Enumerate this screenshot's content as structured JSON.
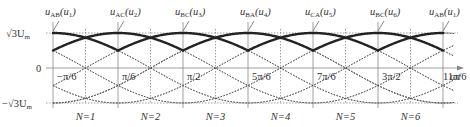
{
  "diagram": {
    "y_axis": {
      "top_label": "√3U",
      "top_sub": "m",
      "zero_label": "0",
      "bottom_label": "−√3U",
      "bottom_sub": "m"
    },
    "x_axis": {
      "label": "ωt",
      "ticks": [
        "−π/6",
        "π/6",
        "π/2",
        "5π/6",
        "7π/6",
        "3π/2",
        "11π/6"
      ]
    },
    "voltage_labels": [
      {
        "main": "u",
        "sub": "AB",
        "paren": "u",
        "psub": "1"
      },
      {
        "main": "u",
        "sub": "AC",
        "paren": "u",
        "psub": "2"
      },
      {
        "main": "u",
        "sub": "BC",
        "paren": "u",
        "psub": "3"
      },
      {
        "main": "u",
        "sub": "BA",
        "paren": "u",
        "psub": "4"
      },
      {
        "main": "u",
        "sub": "CA",
        "paren": "u",
        "psub": "5"
      },
      {
        "main": "u",
        "sub": "BC",
        "paren": "u",
        "psub": "6"
      },
      {
        "main": "u",
        "sub": "AB",
        "paren": "u",
        "psub": "1"
      }
    ],
    "sectors": [
      "N=1",
      "N=2",
      "N=3",
      "N=4",
      "N=5",
      "N=6"
    ],
    "colors": {
      "thick": "#222222",
      "thin": "#555555",
      "grid": "#888888",
      "text": "#333333"
    }
  }
}
